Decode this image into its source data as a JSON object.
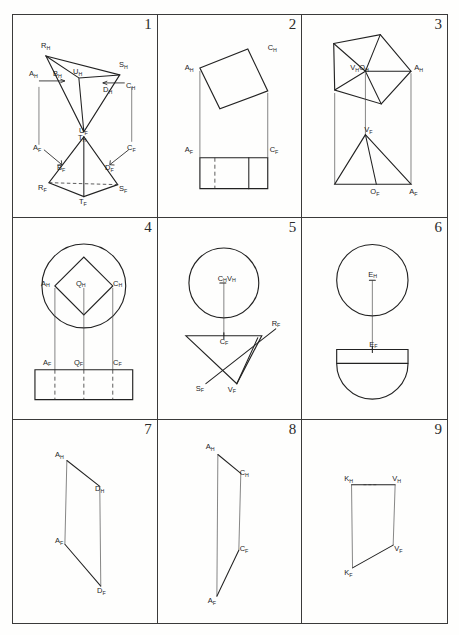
{
  "sheet": {
    "kind": "engineering-drawing-worksheet",
    "layout": {
      "columns": 3,
      "rows": 3
    },
    "ink_color": "#222222",
    "paper_color": "#fefefd"
  },
  "panels": [
    {
      "number": "1",
      "figure": "tetrahedron-two-views",
      "labels": [
        {
          "text": "R",
          "sub": "H"
        },
        {
          "text": "S",
          "sub": "H"
        },
        {
          "text": "T",
          "sub": "H"
        },
        {
          "text": "U",
          "sub": "H"
        },
        {
          "text": "A",
          "sub": "H"
        },
        {
          "text": "B",
          "sub": "H"
        },
        {
          "text": "C",
          "sub": "H"
        },
        {
          "text": "D",
          "sub": "H"
        },
        {
          "text": "U",
          "sub": "F"
        },
        {
          "text": "A",
          "sub": "F"
        },
        {
          "text": "B",
          "sub": "F"
        },
        {
          "text": "C",
          "sub": "F"
        },
        {
          "text": "D",
          "sub": "F"
        },
        {
          "text": "R",
          "sub": "F"
        },
        {
          "text": "S",
          "sub": "F"
        },
        {
          "text": "T",
          "sub": "F"
        }
      ]
    },
    {
      "number": "2",
      "figure": "tilted-square-prism-two-views",
      "labels": [
        {
          "text": "A",
          "sub": "H"
        },
        {
          "text": "C",
          "sub": "H"
        },
        {
          "text": "A",
          "sub": "F"
        },
        {
          "text": "C",
          "sub": "F"
        }
      ]
    },
    {
      "number": "3",
      "figure": "pentagonal-pyramid-two-views",
      "labels": [
        {
          "text": "V",
          "sub": "H"
        },
        {
          "text": "O",
          "sub": "H"
        },
        {
          "text": "A",
          "sub": "H"
        },
        {
          "text": "V",
          "sub": "F"
        },
        {
          "text": "O",
          "sub": "F"
        },
        {
          "text": "A",
          "sub": "F"
        }
      ]
    },
    {
      "number": "4",
      "figure": "cylinder-with-inscribed-square-two-views",
      "labels": [
        {
          "text": "A",
          "sub": "H"
        },
        {
          "text": "Q",
          "sub": "H"
        },
        {
          "text": "C",
          "sub": "H"
        },
        {
          "text": "A",
          "sub": "F"
        },
        {
          "text": "Q",
          "sub": "F"
        },
        {
          "text": "C",
          "sub": "F"
        }
      ]
    },
    {
      "number": "5",
      "figure": "inverted-cone-two-views",
      "labels": [
        {
          "text": "C",
          "sub": "H"
        },
        {
          "text": "V",
          "sub": "H"
        },
        {
          "text": "C",
          "sub": "F"
        },
        {
          "text": "R",
          "sub": "F"
        },
        {
          "text": "S",
          "sub": "F"
        },
        {
          "text": "V",
          "sub": "F"
        }
      ]
    },
    {
      "number": "6",
      "figure": "hemisphere-two-views",
      "labels": [
        {
          "text": "E",
          "sub": "H"
        },
        {
          "text": "E",
          "sub": "F"
        }
      ]
    },
    {
      "number": "7",
      "figure": "line-segment-AD-two-views",
      "labels": [
        {
          "text": "A",
          "sub": "H"
        },
        {
          "text": "D",
          "sub": "H"
        },
        {
          "text": "A",
          "sub": "F"
        },
        {
          "text": "D",
          "sub": "F"
        }
      ]
    },
    {
      "number": "8",
      "figure": "line-segment-AC-two-views",
      "labels": [
        {
          "text": "A",
          "sub": "H"
        },
        {
          "text": "C",
          "sub": "H"
        },
        {
          "text": "C",
          "sub": "F"
        },
        {
          "text": "A",
          "sub": "F"
        }
      ]
    },
    {
      "number": "9",
      "figure": "line-segment-KV-two-views",
      "labels": [
        {
          "text": "K",
          "sub": "H"
        },
        {
          "text": "V",
          "sub": "H"
        },
        {
          "text": "V",
          "sub": "F"
        },
        {
          "text": "K",
          "sub": "F"
        }
      ]
    }
  ]
}
